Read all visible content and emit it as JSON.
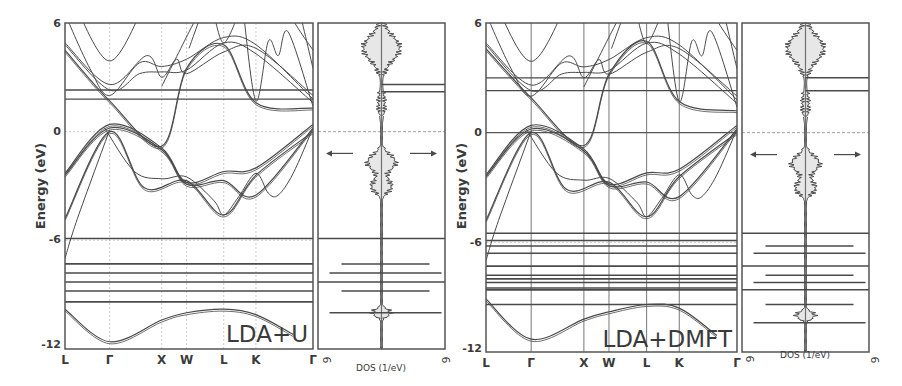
{
  "chart_data": [
    {
      "type": "line",
      "title": "LDA+U",
      "panel": "band-structure",
      "ylabel": "Energy (eV)",
      "ylim": [
        -12,
        6
      ],
      "yticks": [
        "6",
        "0",
        "-6",
        "-12"
      ],
      "kpath": [
        "L",
        "Γ",
        "X",
        "W",
        "L",
        "K",
        "Γ"
      ],
      "kpath_positions": [
        0,
        0.18,
        0.39,
        0.49,
        0.64,
        0.77,
        1.0
      ],
      "fermi_level": 0,
      "flat_bands_eV": [
        -5.9,
        -7.3,
        -7.8,
        -8.3,
        -8.8,
        -9.4
      ],
      "upper_flat_bands_eV": [
        2.3,
        1.8
      ],
      "series": [
        {
          "name": "valence band top",
          "x": [
            0,
            0.18,
            0.39,
            0.49,
            0.64,
            0.77,
            1.0
          ],
          "y": [
            -2.3,
            0.4,
            -0.9,
            -2.8,
            -2.2,
            -2.0,
            0.4
          ]
        },
        {
          "name": "valence band 2",
          "x": [
            0,
            0.18,
            0.39,
            0.49,
            0.64,
            0.77,
            1.0
          ],
          "y": [
            -2.4,
            0.2,
            -1.0,
            -2.9,
            -2.7,
            -3.5,
            0.2
          ]
        },
        {
          "name": "valence band 3",
          "x": [
            0,
            0.18,
            0.32,
            0.49,
            0.64,
            0.77,
            1.0
          ],
          "y": [
            -4.8,
            0.0,
            -3.1,
            -2.7,
            -4.6,
            -2.4,
            0.0
          ]
        },
        {
          "name": "lowest s band",
          "x": [
            0,
            0.18,
            0.39,
            0.49,
            0.64,
            0.77,
            0.92
          ],
          "y": [
            -9.8,
            -11.6,
            -10.4,
            -10.0,
            -9.8,
            -10.1,
            -11.2
          ]
        },
        {
          "name": "conduction band",
          "x": [
            0,
            0.18,
            0.39,
            0.49,
            0.64,
            0.77,
            1.0
          ],
          "y": [
            4.5,
            1.7,
            -0.8,
            3.5,
            4.8,
            1.6,
            1.3
          ]
        }
      ]
    },
    {
      "type": "line",
      "panel": "dos",
      "xlabel": "DOS (1/eV)",
      "xticks": [
        "6",
        "6"
      ],
      "ylim": [
        -12,
        6
      ],
      "annotation": "← →",
      "peaks_eV": [
        5.2,
        2.6,
        2.2,
        -1.7,
        -3.0,
        -5.9,
        -7.3,
        -7.8,
        -8.3,
        -8.8,
        -10.0
      ]
    },
    {
      "type": "line",
      "title": "LDA+DMFT",
      "panel": "band-structure",
      "ylabel": "Energy (eV)",
      "ylim": [
        -12,
        6
      ],
      "yticks": [
        "6",
        "0",
        "-6",
        "-12"
      ],
      "kpath": [
        "L",
        "Γ",
        "X",
        "W",
        "L",
        "K",
        "Γ"
      ],
      "kpath_positions": [
        0,
        0.18,
        0.39,
        0.49,
        0.64,
        0.77,
        1.0
      ],
      "fermi_level": 0,
      "flat_bands_eV": [
        -5.5,
        -5.9,
        -6.2,
        -6.6,
        -7.3,
        -7.8,
        -8.0,
        -8.2,
        -8.5,
        -8.6,
        -9.4
      ],
      "upper_flat_bands_eV": [
        3.0,
        2.3
      ],
      "series": [
        {
          "name": "valence band top",
          "x": [
            0,
            0.18,
            0.39,
            0.49,
            0.64,
            0.77,
            1.0
          ],
          "y": [
            -2.3,
            0.4,
            -0.9,
            -2.8,
            -2.2,
            -2.0,
            0.4
          ]
        },
        {
          "name": "valence band 2",
          "x": [
            0,
            0.18,
            0.39,
            0.49,
            0.64,
            0.77,
            1.0
          ],
          "y": [
            -2.4,
            0.2,
            -1.0,
            -2.9,
            -2.7,
            -3.5,
            0.2
          ]
        },
        {
          "name": "valence band 3",
          "x": [
            0,
            0.18,
            0.32,
            0.49,
            0.64,
            0.77,
            1.0
          ],
          "y": [
            -4.8,
            0.0,
            -3.1,
            -2.7,
            -4.6,
            -2.4,
            0.0
          ]
        },
        {
          "name": "lowest s band",
          "x": [
            0,
            0.18,
            0.39,
            0.49,
            0.64,
            0.77,
            0.92
          ],
          "y": [
            -9.1,
            -11.3,
            -10.2,
            -9.8,
            -9.4,
            -9.6,
            -11.1
          ]
        },
        {
          "name": "conduction band",
          "x": [
            0,
            0.18,
            0.39,
            0.49,
            0.64,
            0.77,
            1.0
          ],
          "y": [
            4.6,
            1.9,
            -0.7,
            3.2,
            5.0,
            1.7,
            1.2
          ]
        }
      ]
    },
    {
      "type": "line",
      "panel": "dos",
      "xlabel": "DOS (1/eV)",
      "xticks": [
        "6",
        "6"
      ],
      "ylim": [
        -12,
        6
      ],
      "annotation": "← →",
      "peaks_eV": [
        5.3,
        3.0,
        2.3,
        -1.7,
        -3.0,
        -5.5,
        -6.2,
        -6.6,
        -7.3,
        -7.8,
        -8.2,
        -8.6,
        -9.4,
        -10.4
      ]
    }
  ],
  "panels": {
    "left": {
      "label": "LDA+U",
      "ylabel": "Energy (eV)",
      "yticks": [
        "6",
        "0",
        "-6",
        "-12"
      ],
      "kpoints": [
        "L",
        "Γ",
        "X",
        "W",
        "L",
        "K",
        "Γ"
      ],
      "dos_label": "DOS (1/eV)",
      "dos_tick_left": "6",
      "dos_tick_right": "6"
    },
    "right": {
      "label": "LDA+DMFT",
      "ylabel": "Energy (eV)",
      "yticks": [
        "6",
        "0",
        "-6",
        "-12"
      ],
      "kpoints": [
        "L",
        "Γ",
        "X",
        "W",
        "L",
        "K",
        "Γ"
      ],
      "dos_label": "DOS (1/eV)",
      "dos_tick_left": "6",
      "dos_tick_right": "6"
    }
  },
  "colors": {
    "line": "#4a4a4a",
    "grid": "#bdbdbd",
    "frame": "#555555",
    "fermi": "#888888"
  }
}
